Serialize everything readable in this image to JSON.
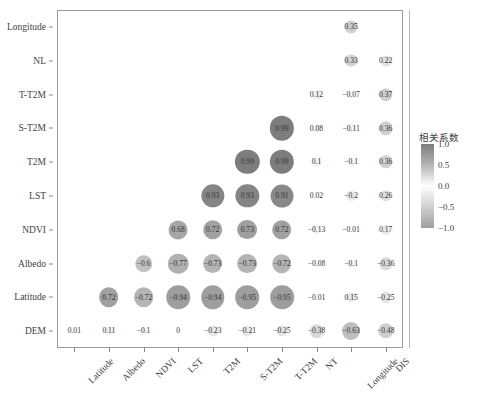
{
  "chart_data": {
    "type": "heatmap",
    "title": "",
    "xlabel": "",
    "ylabel": "",
    "categories_x": [
      "Latitude",
      "Albedo",
      "NDVI",
      "LST",
      "T2M",
      "S-T2M",
      "T-T2M",
      "NT",
      "Longitude",
      "DIS"
    ],
    "categories_y": [
      "Longitude",
      "NL",
      "T-T2M",
      "S-T2M",
      "T2M",
      "LST",
      "NDVI",
      "Albedo",
      "Latitude",
      "DEM"
    ],
    "legend": {
      "title": "相关系数",
      "ticks": [
        "1.0",
        "0.5",
        "0.0",
        "-0.5",
        "-1.0"
      ],
      "tick_values": [
        1.0,
        0.5,
        0.0,
        -0.5,
        -1.0
      ],
      "position": "right",
      "colormap": "grayscale"
    },
    "zlim": [
      -1.0,
      1.0
    ],
    "grid": false,
    "lower_triangle_only": true,
    "cells": [
      {
        "row": "Longitude",
        "col": "Longitude",
        "label": "0.35",
        "value": 0.35
      },
      {
        "row": "NL",
        "col": "Longitude",
        "label": "0.33",
        "value": 0.33
      },
      {
        "row": "NL",
        "col": "DIS",
        "label": "0.22",
        "value": 0.22
      },
      {
        "row": "T-T2M",
        "col": "NT",
        "label": "0.12",
        "value": 0.12
      },
      {
        "row": "T-T2M",
        "col": "Longitude",
        "label": "-0.07",
        "value": -0.07
      },
      {
        "row": "T-T2M",
        "col": "DIS",
        "label": "0.37",
        "value": 0.37
      },
      {
        "row": "S-T2M",
        "col": "T-T2M",
        "label": "0.99",
        "value": 0.99
      },
      {
        "row": "S-T2M",
        "col": "NT",
        "label": "0.08",
        "value": 0.08
      },
      {
        "row": "S-T2M",
        "col": "Longitude",
        "label": "-0.11",
        "value": -0.11
      },
      {
        "row": "S-T2M",
        "col": "DIS",
        "label": "0.36",
        "value": 0.36
      },
      {
        "row": "T2M",
        "col": "S-T2M",
        "label": "0.99",
        "value": 0.99
      },
      {
        "row": "T2M",
        "col": "T-T2M",
        "label": "0.99",
        "value": 0.99
      },
      {
        "row": "T2M",
        "col": "NT",
        "label": "0.1",
        "value": 0.1
      },
      {
        "row": "T2M",
        "col": "Longitude",
        "label": "-0.1",
        "value": -0.1
      },
      {
        "row": "T2M",
        "col": "DIS",
        "label": "0.36",
        "value": 0.36
      },
      {
        "row": "LST",
        "col": "T2M",
        "label": "0.93",
        "value": 0.93
      },
      {
        "row": "LST",
        "col": "S-T2M",
        "label": "0.93",
        "value": 0.93
      },
      {
        "row": "LST",
        "col": "T-T2M",
        "label": "0.91",
        "value": 0.91
      },
      {
        "row": "LST",
        "col": "NT",
        "label": "0.02",
        "value": 0.02
      },
      {
        "row": "LST",
        "col": "Longitude",
        "label": "-0.2",
        "value": -0.2
      },
      {
        "row": "LST",
        "col": "DIS",
        "label": "0.26",
        "value": 0.26
      },
      {
        "row": "NDVI",
        "col": "LST",
        "label": "0.68",
        "value": 0.68
      },
      {
        "row": "NDVI",
        "col": "T2M",
        "label": "0.72",
        "value": 0.72
      },
      {
        "row": "NDVI",
        "col": "S-T2M",
        "label": "0.73",
        "value": 0.73
      },
      {
        "row": "NDVI",
        "col": "T-T2M",
        "label": "0.72",
        "value": 0.72
      },
      {
        "row": "NDVI",
        "col": "NT",
        "label": "-0.13",
        "value": -0.13
      },
      {
        "row": "NDVI",
        "col": "Longitude",
        "label": "-0.01",
        "value": -0.01
      },
      {
        "row": "NDVI",
        "col": "DIS",
        "label": "0.17",
        "value": 0.17
      },
      {
        "row": "Albedo",
        "col": "NDVI",
        "label": "-0.6",
        "value": -0.6
      },
      {
        "row": "Albedo",
        "col": "LST",
        "label": "-0.77",
        "value": -0.77
      },
      {
        "row": "Albedo",
        "col": "T2M",
        "label": "-0.73",
        "value": -0.73
      },
      {
        "row": "Albedo",
        "col": "S-T2M",
        "label": "-0.73",
        "value": -0.73
      },
      {
        "row": "Albedo",
        "col": "T-T2M",
        "label": "-0.72",
        "value": -0.72
      },
      {
        "row": "Albedo",
        "col": "NT",
        "label": "-0.08",
        "value": -0.08
      },
      {
        "row": "Albedo",
        "col": "Longitude",
        "label": "-0.1",
        "value": -0.1
      },
      {
        "row": "Albedo",
        "col": "DIS",
        "label": "-0.36",
        "value": -0.36
      },
      {
        "row": "Latitude",
        "col": "Albedo",
        "label": "0.72",
        "value": 0.72
      },
      {
        "row": "Latitude",
        "col": "NDVI",
        "label": "-0.72",
        "value": -0.72
      },
      {
        "row": "Latitude",
        "col": "LST",
        "label": "-0.94",
        "value": -0.94
      },
      {
        "row": "Latitude",
        "col": "T2M",
        "label": "-0.94",
        "value": -0.94
      },
      {
        "row": "Latitude",
        "col": "S-T2M",
        "label": "-0.95",
        "value": -0.95
      },
      {
        "row": "Latitude",
        "col": "T-T2M",
        "label": "-0.95",
        "value": -0.95
      },
      {
        "row": "Latitude",
        "col": "NT",
        "label": "-0.01",
        "value": -0.01
      },
      {
        "row": "Latitude",
        "col": "Longitude",
        "label": "0.15",
        "value": 0.15
      },
      {
        "row": "Latitude",
        "col": "DIS",
        "label": "-0.25",
        "value": -0.25
      },
      {
        "row": "DEM",
        "col": "Latitude",
        "label": "0.01",
        "value": 0.01
      },
      {
        "row": "DEM",
        "col": "Albedo",
        "label": "0.11",
        "value": 0.11
      },
      {
        "row": "DEM",
        "col": "NDVI",
        "label": "-0.1",
        "value": -0.1
      },
      {
        "row": "DEM",
        "col": "LST",
        "label": "0",
        "value": 0
      },
      {
        "row": "DEM",
        "col": "T2M",
        "label": "-0.23",
        "value": -0.23
      },
      {
        "row": "DEM",
        "col": "S-T2M",
        "label": "-0.21",
        "value": -0.21
      },
      {
        "row": "DEM",
        "col": "T-T2M",
        "label": "-0.25",
        "value": -0.25
      },
      {
        "row": "DEM",
        "col": "NT",
        "label": "-0.38",
        "value": -0.38
      },
      {
        "row": "DEM",
        "col": "Longitude",
        "label": "-0.63",
        "value": -0.63
      },
      {
        "row": "DEM",
        "col": "DIS",
        "label": "-0.48",
        "value": -0.48
      }
    ]
  }
}
